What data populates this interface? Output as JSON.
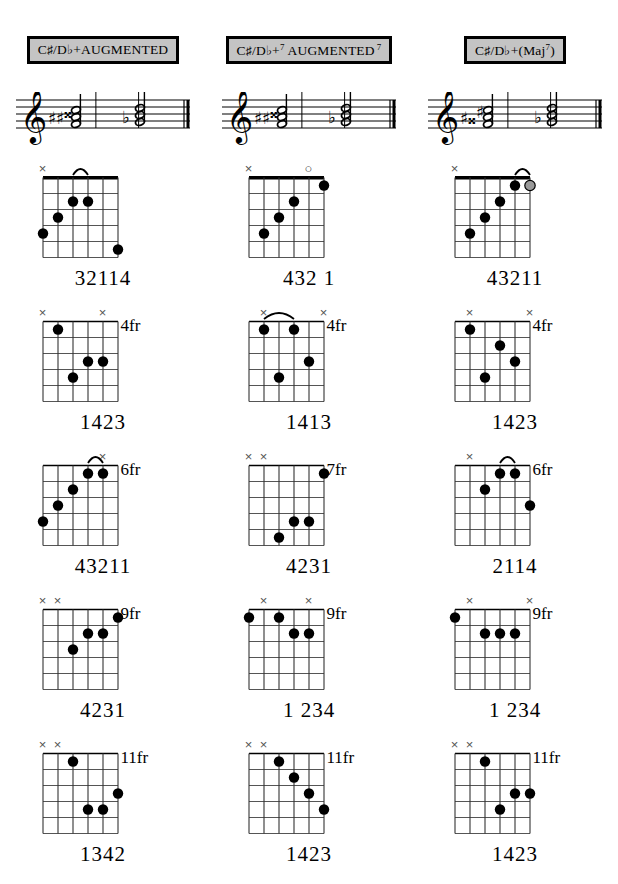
{
  "columns": [
    {
      "title_html": "C#/Db+AUGMENTED",
      "root": "C#/Db",
      "quality": "+AUGMENTED",
      "suffix": "",
      "staff_accidentals": [
        "sharp",
        "sharp",
        "doublesharp",
        "flat"
      ],
      "diagrams": [
        {
          "fret_label": "",
          "base_fret": 1,
          "nut": true,
          "markers": [
            {
              "string": 1,
              "type": "x"
            }
          ],
          "arcs": [
            {
              "from": 3,
              "to": 4,
              "fret": 2
            }
          ],
          "dots": [
            {
              "string": 3,
              "fret": 2,
              "style": "filled"
            },
            {
              "string": 4,
              "fret": 2,
              "style": "filled"
            },
            {
              "string": 2,
              "fret": 3,
              "style": "filled"
            },
            {
              "string": 1,
              "fret": 4,
              "style": "filled"
            },
            {
              "string": 6,
              "fret": 5,
              "style": "filled"
            }
          ],
          "fingering": "32114"
        },
        {
          "fret_label": "4fr",
          "base_fret": 4,
          "nut": false,
          "markers": [
            {
              "string": 1,
              "type": "x"
            },
            {
              "string": 5,
              "type": "x"
            }
          ],
          "arcs": [],
          "dots": [
            {
              "string": 2,
              "fret": 1,
              "style": "filled"
            },
            {
              "string": 4,
              "fret": 3,
              "style": "filled"
            },
            {
              "string": 5,
              "fret": 3,
              "style": "filled"
            },
            {
              "string": 3,
              "fret": 4,
              "style": "filled"
            }
          ],
          "fingering": "1423"
        },
        {
          "fret_label": "6fr",
          "base_fret": 6,
          "nut": false,
          "markers": [
            {
              "string": 5,
              "type": "x"
            }
          ],
          "arcs": [
            {
              "from": 4,
              "to": 5,
              "fret": 1
            }
          ],
          "dots": [
            {
              "string": 4,
              "fret": 1,
              "style": "filled"
            },
            {
              "string": 5,
              "fret": 1,
              "style": "filled"
            },
            {
              "string": 3,
              "fret": 2,
              "style": "filled"
            },
            {
              "string": 2,
              "fret": 3,
              "style": "filled"
            },
            {
              "string": 1,
              "fret": 4,
              "style": "filled"
            }
          ],
          "fingering": "43211"
        },
        {
          "fret_label": "9fr",
          "base_fret": 9,
          "nut": false,
          "markers": [
            {
              "string": 1,
              "type": "x"
            },
            {
              "string": 2,
              "type": "x"
            }
          ],
          "arcs": [],
          "dots": [
            {
              "string": 6,
              "fret": 1,
              "style": "filled"
            },
            {
              "string": 4,
              "fret": 2,
              "style": "filled"
            },
            {
              "string": 5,
              "fret": 2,
              "style": "filled"
            },
            {
              "string": 3,
              "fret": 3,
              "style": "filled"
            }
          ],
          "fingering": "4231"
        },
        {
          "fret_label": "11fr",
          "base_fret": 11,
          "nut": false,
          "markers": [
            {
              "string": 1,
              "type": "x"
            },
            {
              "string": 2,
              "type": "x"
            }
          ],
          "arcs": [],
          "dots": [
            {
              "string": 3,
              "fret": 1,
              "style": "filled"
            },
            {
              "string": 6,
              "fret": 3,
              "style": "filled"
            },
            {
              "string": 4,
              "fret": 4,
              "style": "filled"
            },
            {
              "string": 5,
              "fret": 4,
              "style": "filled"
            }
          ],
          "fingering": "1342"
        }
      ]
    },
    {
      "title_html": "C#/Db+7 AUGMENTED 7",
      "root": "C#/Db",
      "quality": "+7 AUGMENTED",
      "suffix": "7",
      "staff_accidentals": [
        "sharp",
        "sharp",
        "doublesharp",
        "flat"
      ],
      "diagrams": [
        {
          "fret_label": "",
          "base_fret": 1,
          "nut": true,
          "markers": [
            {
              "string": 1,
              "type": "x"
            },
            {
              "string": 5,
              "type": "o"
            }
          ],
          "arcs": [],
          "dots": [
            {
              "string": 6,
              "fret": 1,
              "style": "filled"
            },
            {
              "string": 4,
              "fret": 2,
              "style": "filled"
            },
            {
              "string": 3,
              "fret": 3,
              "style": "filled"
            },
            {
              "string": 2,
              "fret": 4,
              "style": "filled"
            }
          ],
          "fingering": "432 1"
        },
        {
          "fret_label": "4fr",
          "base_fret": 4,
          "nut": false,
          "markers": [
            {
              "string": 2,
              "type": "x"
            },
            {
              "string": 6,
              "type": "x"
            }
          ],
          "arcs": [
            {
              "from": 2,
              "to": 4,
              "fret": 1
            }
          ],
          "dots": [
            {
              "string": 2,
              "fret": 1,
              "style": "filled"
            },
            {
              "string": 4,
              "fret": 1,
              "style": "filled"
            },
            {
              "string": 5,
              "fret": 3,
              "style": "filled"
            },
            {
              "string": 3,
              "fret": 4,
              "style": "filled"
            }
          ],
          "fingering": "1413"
        },
        {
          "fret_label": "7fr",
          "base_fret": 7,
          "nut": false,
          "markers": [
            {
              "string": 1,
              "type": "x"
            },
            {
              "string": 2,
              "type": "x"
            }
          ],
          "arcs": [],
          "dots": [
            {
              "string": 6,
              "fret": 1,
              "style": "filled"
            },
            {
              "string": 4,
              "fret": 4,
              "style": "filled"
            },
            {
              "string": 5,
              "fret": 4,
              "style": "filled"
            },
            {
              "string": 3,
              "fret": 5,
              "style": "filled"
            }
          ],
          "fingering": "4231"
        },
        {
          "fret_label": "9fr",
          "base_fret": 9,
          "nut": false,
          "markers": [
            {
              "string": 2,
              "type": "x"
            },
            {
              "string": 5,
              "type": "x"
            }
          ],
          "arcs": [],
          "dots": [
            {
              "string": 1,
              "fret": 1,
              "style": "filled"
            },
            {
              "string": 3,
              "fret": 1,
              "style": "filled"
            },
            {
              "string": 4,
              "fret": 2,
              "style": "filled"
            },
            {
              "string": 5,
              "fret": 2,
              "style": "filled"
            }
          ],
          "fingering": "1 234"
        },
        {
          "fret_label": "11fr",
          "base_fret": 11,
          "nut": false,
          "markers": [
            {
              "string": 1,
              "type": "x"
            },
            {
              "string": 2,
              "type": "x"
            }
          ],
          "arcs": [],
          "dots": [
            {
              "string": 3,
              "fret": 1,
              "style": "filled"
            },
            {
              "string": 4,
              "fret": 2,
              "style": "filled"
            },
            {
              "string": 5,
              "fret": 3,
              "style": "filled"
            },
            {
              "string": 6,
              "fret": 4,
              "style": "filled"
            }
          ],
          "fingering": "1423"
        }
      ]
    },
    {
      "title_html": "C#/Db+(Maj7)",
      "root": "C#/Db",
      "quality": "+(Maj",
      "suffix": "7",
      "staff_accidentals": [
        "sharp",
        "doublesharp",
        "sharp",
        "flat"
      ],
      "diagrams": [
        {
          "fret_label": "",
          "base_fret": 1,
          "nut": true,
          "markers": [
            {
              "string": 1,
              "type": "x"
            }
          ],
          "arcs": [
            {
              "from": 5,
              "to": 6,
              "fret": 1
            }
          ],
          "dots": [
            {
              "string": 5,
              "fret": 1,
              "style": "filled"
            },
            {
              "string": 6,
              "fret": 1,
              "style": "gray"
            },
            {
              "string": 4,
              "fret": 2,
              "style": "filled"
            },
            {
              "string": 3,
              "fret": 3,
              "style": "filled"
            },
            {
              "string": 2,
              "fret": 4,
              "style": "filled"
            }
          ],
          "fingering": "43211"
        },
        {
          "fret_label": "4fr",
          "base_fret": 4,
          "nut": false,
          "markers": [
            {
              "string": 2,
              "type": "x"
            },
            {
              "string": 6,
              "type": "x"
            }
          ],
          "arcs": [],
          "dots": [
            {
              "string": 2,
              "fret": 1,
              "style": "filled"
            },
            {
              "string": 4,
              "fret": 2,
              "style": "filled"
            },
            {
              "string": 5,
              "fret": 3,
              "style": "filled"
            },
            {
              "string": 3,
              "fret": 4,
              "style": "filled"
            }
          ],
          "fingering": "1423"
        },
        {
          "fret_label": "6fr",
          "base_fret": 6,
          "nut": false,
          "markers": [
            {
              "string": 2,
              "type": "x"
            }
          ],
          "arcs": [
            {
              "from": 4,
              "to": 5,
              "fret": 1
            }
          ],
          "dots": [
            {
              "string": 4,
              "fret": 1,
              "style": "filled"
            },
            {
              "string": 5,
              "fret": 1,
              "style": "filled"
            },
            {
              "string": 3,
              "fret": 2,
              "style": "filled"
            },
            {
              "string": 6,
              "fret": 3,
              "style": "filled"
            }
          ],
          "fingering": "2114"
        },
        {
          "fret_label": "9fr",
          "base_fret": 9,
          "nut": false,
          "markers": [
            {
              "string": 2,
              "type": "x"
            },
            {
              "string": 6,
              "type": "x"
            }
          ],
          "arcs": [],
          "dots": [
            {
              "string": 1,
              "fret": 1,
              "style": "filled"
            },
            {
              "string": 3,
              "fret": 2,
              "style": "filled"
            },
            {
              "string": 4,
              "fret": 2,
              "style": "filled"
            },
            {
              "string": 5,
              "fret": 2,
              "style": "filled"
            }
          ],
          "fingering": "1 234"
        },
        {
          "fret_label": "11fr",
          "base_fret": 11,
          "nut": false,
          "markers": [
            {
              "string": 1,
              "type": "x"
            },
            {
              "string": 2,
              "type": "x"
            }
          ],
          "arcs": [],
          "dots": [
            {
              "string": 3,
              "fret": 1,
              "style": "filled"
            },
            {
              "string": 5,
              "fret": 3,
              "style": "filled"
            },
            {
              "string": 6,
              "fret": 3,
              "style": "filled"
            },
            {
              "string": 4,
              "fret": 4,
              "style": "filled"
            }
          ],
          "fingering": "1423"
        }
      ]
    }
  ],
  "style": {
    "header_bg": "#c4c4c4",
    "ink": "#000000",
    "marker_gray": "#808080",
    "gray_dot": "#999999"
  }
}
